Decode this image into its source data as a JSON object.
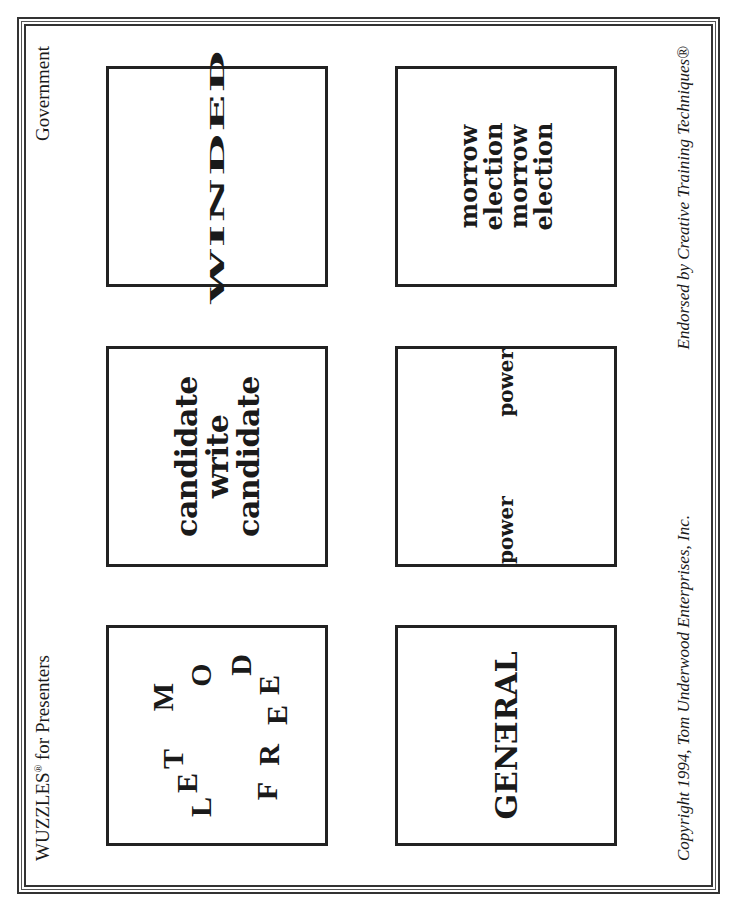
{
  "header": {
    "title_main": "WUZZLES",
    "title_reg": "®",
    "title_rest": " for Presenters",
    "category": "Government"
  },
  "footer": {
    "copyright": "Copyright 1994, Tom Underwood Enterprises, Inc.",
    "endorsement": "Endorsed by Creative Training Techniques®"
  },
  "puzzles": [
    {
      "number": "7",
      "type": "letter-ring",
      "letters": [
        "L",
        "E",
        "T",
        "M",
        "O",
        "D",
        "E",
        "E",
        "R",
        "F"
      ]
    },
    {
      "number": "8",
      "type": "stacked-lines",
      "lines": [
        "candidate",
        "write",
        "candidate"
      ]
    },
    {
      "number": "9",
      "type": "squashed-word",
      "word": "WINDED"
    },
    {
      "number": "10",
      "type": "reversed-letter",
      "before": "GEN",
      "reversed": "E",
      "after": "RAL"
    },
    {
      "number": "11",
      "type": "separated-words",
      "left": "power",
      "right": "power"
    },
    {
      "number": "12",
      "type": "stacked-lines",
      "lines": [
        "morrow election",
        "morrow election"
      ]
    }
  ]
}
